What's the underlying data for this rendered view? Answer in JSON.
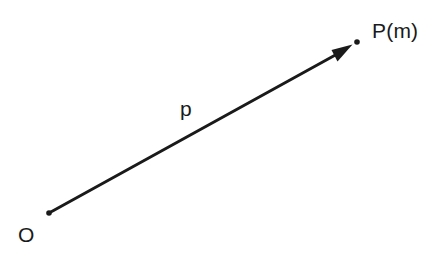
{
  "diagram": {
    "background_color": "#ffffff",
    "stroke_color": "#1a1a1a",
    "labels": {
      "origin": "O",
      "vector": "p",
      "point": "P(m)"
    },
    "geometry": {
      "origin_point": {
        "x": 49,
        "y": 213
      },
      "end_point": {
        "x": 357,
        "y": 42
      },
      "arrow_tip": {
        "x": 352,
        "y": 45
      },
      "line_start": {
        "x": 49,
        "y": 213
      },
      "line_end": {
        "x": 344,
        "y": 50
      },
      "stroke_width": 3,
      "dot_radius": 2.6
    }
  }
}
